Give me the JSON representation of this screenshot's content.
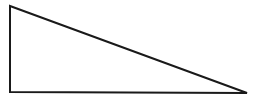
{
  "diagram": {
    "type": "right-triangle",
    "stroke_color": "#1a1a1a",
    "fill_color": "#ffffff",
    "stroke_width": 2,
    "vertices": [
      {
        "name": "top-left",
        "x": 10,
        "y": 6
      },
      {
        "name": "bottom-left",
        "x": 10,
        "y": 92
      },
      {
        "name": "bottom-right",
        "x": 247,
        "y": 93
      }
    ]
  }
}
